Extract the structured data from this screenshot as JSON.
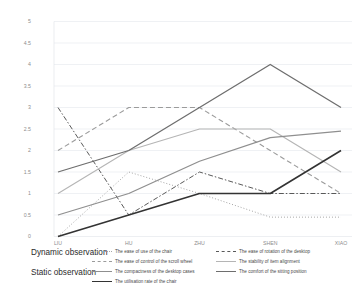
{
  "groups": {
    "dynamic_label": "Dynamic observation",
    "static_label": "Static observation"
  },
  "chart_data": {
    "type": "line",
    "title": "",
    "xlabel": "",
    "ylabel": "",
    "ylim": [
      0,
      5
    ],
    "yticks": [
      "0",
      "0.5",
      "1",
      "1.5",
      "2",
      "2.5",
      "3",
      "3.5",
      "4",
      "4.5",
      "5"
    ],
    "grid": true,
    "legend_position": "bottom",
    "categories": [
      "LIU",
      "HU",
      "ZHU",
      "SHEN",
      "XIAO"
    ],
    "series": [
      {
        "name": "The ease of use of the chair",
        "group": "dynamic",
        "style": "dotted",
        "color": "#a6a6a6",
        "width": 1.0,
        "dash": "1,2",
        "values": [
          0,
          1.5,
          1,
          0.45,
          0.45
        ]
      },
      {
        "name": "The ease of rotation of the desktop",
        "group": "dynamic",
        "style": "dash-dot",
        "color": "#595959",
        "width": 1.0,
        "dash": "5,2,1.5,2",
        "values": [
          3,
          0.5,
          1.5,
          1,
          1
        ]
      },
      {
        "name": "The ease of control of the scroll wheel",
        "group": "dynamic",
        "style": "dashed",
        "color": "#9b9b9b",
        "width": 1.1,
        "dash": "5,3",
        "values": [
          2,
          3,
          3,
          2,
          1
        ]
      },
      {
        "name": "The stability of item alignment",
        "group": "dynamic",
        "style": "solid",
        "color": "#b5b5b5",
        "width": 1.1,
        "dash": "",
        "values": [
          1,
          2,
          2.5,
          2.5,
          1.5
        ]
      },
      {
        "name": "The compactness of the desktop cases",
        "group": "static",
        "style": "solid",
        "color": "#8f8f8f",
        "width": 1.3,
        "dash": "",
        "values": [
          0.5,
          1,
          1.75,
          2.3,
          2.45
        ]
      },
      {
        "name": "The comfort of the sitting position",
        "group": "static",
        "style": "solid",
        "color": "#6e6e6e",
        "width": 1.3,
        "dash": "",
        "values": [
          1.5,
          2,
          3,
          4,
          3
        ]
      },
      {
        "name": "The utilisation rate of the chair",
        "group": "static",
        "style": "solid",
        "color": "#333333",
        "width": 1.6,
        "dash": "",
        "values": [
          0,
          0.5,
          1,
          1,
          2
        ]
      }
    ]
  }
}
